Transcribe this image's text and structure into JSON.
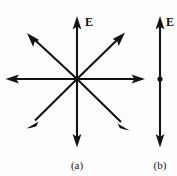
{
  "figure": {
    "background_color": "#fdfdfd",
    "stroke_color": "#141414",
    "panels": [
      {
        "id": "a",
        "caption": "(a)",
        "caption_x": 77,
        "caption_y": 165,
        "description": "eight field arrows radiating outward from a central point",
        "center": {
          "x": 77,
          "y": 79
        },
        "field_label": "E",
        "field_label_x": 85,
        "field_label_y": 22,
        "arrow_count": 8,
        "arrows": [
          {
            "name": "up",
            "angle_deg": 90,
            "tip_x": 77,
            "tip_y": 17
          },
          {
            "name": "up-right",
            "angle_deg": 45,
            "tip_x": 124,
            "tip_y": 33
          },
          {
            "name": "right",
            "angle_deg": 0,
            "tip_x": 145,
            "tip_y": 79
          },
          {
            "name": "down-right",
            "angle_deg": -45,
            "tip_x": 129,
            "tip_y": 130
          },
          {
            "name": "down",
            "angle_deg": -90,
            "tip_x": 77,
            "tip_y": 147
          },
          {
            "name": "down-left",
            "angle_deg": -135,
            "tip_x": 27,
            "tip_y": 128
          },
          {
            "name": "left",
            "angle_deg": 180,
            "tip_x": 6,
            "tip_y": 79
          },
          {
            "name": "up-left",
            "angle_deg": 135,
            "tip_x": 27,
            "tip_y": 33
          }
        ]
      },
      {
        "id": "b",
        "caption": "(b)",
        "caption_x": 160,
        "caption_y": 165,
        "description": "single vertical double-headed field line with a point charge dot at its midpoint",
        "field_label": "E",
        "field_label_x": 166,
        "field_label_y": 22,
        "line_x": 160,
        "line_top_y": 17,
        "line_bottom_y": 147,
        "dot": {
          "x": 160,
          "y": 79,
          "radius": 2.6
        }
      }
    ]
  }
}
